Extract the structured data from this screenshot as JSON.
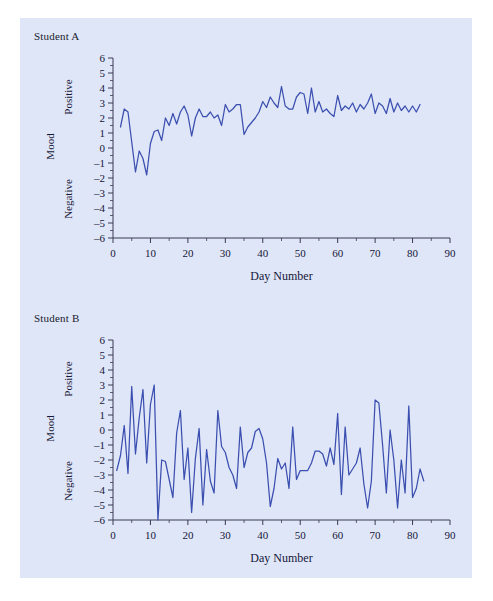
{
  "figure": {
    "background_color": "#dfe6f7",
    "series_color": "#3b4fb0",
    "axis_color": "#3a3a55"
  },
  "chart_data": [
    {
      "type": "line",
      "title": "Student A",
      "xlabel": "Day Number",
      "ylabel": "Mood",
      "ylabel_positive": "Positive",
      "ylabel_negative": "Negative",
      "xlim": [
        0,
        90
      ],
      "ylim": [
        -6,
        6
      ],
      "xticks": [
        0,
        10,
        20,
        30,
        40,
        50,
        60,
        70,
        80,
        90
      ],
      "xtick_labels": [
        "0",
        "10",
        "20",
        "30",
        "40",
        "50",
        "60",
        "70",
        "80",
        "90"
      ],
      "xminor_step": 5,
      "yticks": [
        6,
        5,
        4,
        3,
        2,
        1,
        0,
        -1,
        -2,
        -3,
        -4,
        -5,
        -6
      ],
      "ytick_labels": [
        "6",
        "5",
        "4",
        "3",
        "2",
        "1",
        "0",
        "–1",
        "–2",
        "–3",
        "–4",
        "–5",
        "–6"
      ],
      "grid": false,
      "legend": "none",
      "x": [
        2,
        3,
        4,
        5,
        6,
        7,
        8,
        9,
        10,
        11,
        12,
        13,
        14,
        15,
        16,
        17,
        18,
        19,
        20,
        21,
        22,
        23,
        24,
        25,
        26,
        27,
        28,
        29,
        30,
        31,
        32,
        33,
        34,
        35,
        36,
        37,
        38,
        39,
        40,
        41,
        42,
        43,
        44,
        45,
        46,
        47,
        48,
        49,
        50,
        51,
        52,
        53,
        54,
        55,
        56,
        57,
        58,
        59,
        60,
        61,
        62,
        63,
        64,
        65,
        66,
        67,
        68,
        69,
        70,
        71,
        72,
        73,
        74,
        75,
        76,
        77,
        78,
        79,
        80,
        81,
        82
      ],
      "values": [
        1.4,
        2.6,
        2.4,
        0.4,
        -1.6,
        -0.2,
        -0.7,
        -1.8,
        0.3,
        1.1,
        1.2,
        0.5,
        2.0,
        1.5,
        2.3,
        1.6,
        2.4,
        2.8,
        2.2,
        0.8,
        2.0,
        2.6,
        2.1,
        2.1,
        2.4,
        2.0,
        2.2,
        1.5,
        2.9,
        2.4,
        2.6,
        2.9,
        2.9,
        0.9,
        1.4,
        1.7,
        2.0,
        2.4,
        3.1,
        2.7,
        3.4,
        3.0,
        2.7,
        4.1,
        2.8,
        2.6,
        2.6,
        3.4,
        3.7,
        3.6,
        2.3,
        4.0,
        2.4,
        3.1,
        2.4,
        2.6,
        2.3,
        2.1,
        3.5,
        2.5,
        2.8,
        2.6,
        3.0,
        2.4,
        2.9,
        2.6,
        3.0,
        3.6,
        2.3,
        3.0,
        2.8,
        2.3,
        3.3,
        2.4,
        3.0,
        2.5,
        2.8,
        2.4,
        2.8,
        2.4,
        2.9
      ]
    },
    {
      "type": "line",
      "title": "Student B",
      "xlabel": "Day Number",
      "ylabel": "Mood",
      "ylabel_positive": "Positive",
      "ylabel_negative": "Negative",
      "xlim": [
        0,
        90
      ],
      "ylim": [
        -6,
        6
      ],
      "xticks": [
        0,
        10,
        20,
        30,
        40,
        50,
        60,
        70,
        80,
        90
      ],
      "xtick_labels": [
        "0",
        "10",
        "20",
        "30",
        "40",
        "50",
        "60",
        "70",
        "80",
        "90"
      ],
      "xminor_step": 5,
      "yticks": [
        6,
        5,
        4,
        3,
        2,
        1,
        0,
        -1,
        -2,
        -3,
        -4,
        -5,
        -6
      ],
      "ytick_labels": [
        "6",
        "5",
        "4",
        "3",
        "2",
        "1",
        "0",
        "–1",
        "–2",
        "–3",
        "–4",
        "–5",
        "–6"
      ],
      "grid": false,
      "legend": "none",
      "x": [
        1,
        2,
        3,
        4,
        5,
        6,
        7,
        8,
        9,
        10,
        11,
        12,
        13,
        14,
        15,
        16,
        17,
        18,
        19,
        20,
        21,
        22,
        23,
        24,
        25,
        26,
        27,
        28,
        29,
        30,
        31,
        32,
        33,
        34,
        35,
        36,
        37,
        38,
        39,
        40,
        41,
        42,
        43,
        44,
        45,
        46,
        47,
        48,
        49,
        50,
        51,
        52,
        53,
        54,
        55,
        56,
        57,
        58,
        59,
        60,
        61,
        62,
        63,
        64,
        65,
        66,
        67,
        68,
        69,
        70,
        71,
        72,
        73,
        74,
        75,
        76,
        77,
        78,
        79,
        80,
        81,
        82,
        83
      ],
      "values": [
        -2.7,
        -1.7,
        0.3,
        -2.9,
        2.9,
        -1.6,
        0.8,
        2.7,
        -2.2,
        1.7,
        3.0,
        -6.0,
        -2.0,
        -2.1,
        -3.3,
        -4.5,
        -0.2,
        1.3,
        -3.3,
        -1.2,
        -5.5,
        -1.9,
        0.1,
        -5.0,
        -1.3,
        -3.4,
        -4.2,
        1.3,
        -1.1,
        -1.5,
        -2.5,
        -3.0,
        -3.9,
        0.2,
        -2.5,
        -1.5,
        -1.2,
        -0.1,
        0.1,
        -0.6,
        -2.2,
        -5.1,
        -3.9,
        -1.9,
        -2.6,
        -2.2,
        -3.9,
        0.2,
        -3.3,
        -2.7,
        -2.7,
        -2.7,
        -2.2,
        -1.4,
        -1.4,
        -1.6,
        -2.4,
        -1.2,
        -2.3,
        1.1,
        -4.3,
        0.2,
        -3.0,
        -2.6,
        -2.2,
        -1.2,
        -3.6,
        -5.2,
        -3.4,
        2.0,
        1.8,
        -1.0,
        -4.2,
        0.0,
        -2.0,
        -5.2,
        -2.0,
        -4.2,
        1.6,
        -4.5,
        -3.9,
        -2.6,
        -3.4
      ]
    }
  ]
}
